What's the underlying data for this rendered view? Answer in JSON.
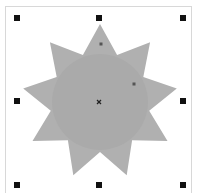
{
  "canvas": {
    "shape": {
      "type": "star",
      "points": 9,
      "center": [
        100,
        102
      ],
      "outer_radius": 78,
      "inner_radius": 50,
      "fill": "#b0b0b0",
      "inner_circle_fill": "#aaaaaa"
    },
    "handles": [
      {
        "name": "handle-top-left",
        "x": 17,
        "y": 18
      },
      {
        "name": "handle-top-center",
        "x": 99,
        "y": 18
      },
      {
        "name": "handle-top-right",
        "x": 183,
        "y": 18
      },
      {
        "name": "handle-middle-left",
        "x": 17,
        "y": 101
      },
      {
        "name": "handle-middle-right",
        "x": 183,
        "y": 101
      },
      {
        "name": "handle-bottom-left",
        "x": 17,
        "y": 185
      },
      {
        "name": "handle-bottom-center",
        "x": 99,
        "y": 185
      },
      {
        "name": "handle-bottom-right",
        "x": 183,
        "y": 185
      }
    ],
    "node_markers": [
      {
        "name": "outer-node-handle",
        "x": 101,
        "y": 44
      },
      {
        "name": "inner-node-handle",
        "x": 134,
        "y": 84
      }
    ],
    "center_marker": {
      "x": 99,
      "y": 102,
      "icon": "x-mark-icon"
    }
  }
}
